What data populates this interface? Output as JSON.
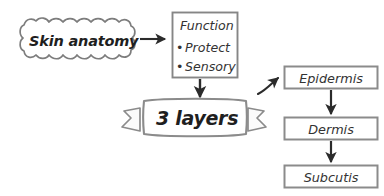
{
  "diagram": {
    "background_color": "#ffffff",
    "stroke_color": "#808080",
    "arrow_color": "#2b2b2b",
    "text_color": "#333333"
  },
  "cloud": {
    "label": "Skin anatomy",
    "shape": "wavy-rounded-rectangle"
  },
  "function_box": {
    "title": "Function",
    "bullets": [
      {
        "marker": "•",
        "label": "Protect"
      },
      {
        "marker": "•",
        "label": "Sensory"
      }
    ]
  },
  "banner": {
    "label": "3 layers",
    "shape": "ribbon-banner"
  },
  "layers": {
    "items": [
      {
        "label": "Epidermis"
      },
      {
        "label": "Dermis"
      },
      {
        "label": "Subcutis"
      }
    ]
  },
  "connectors": [
    {
      "name": "cloud-to-function",
      "direction": "right",
      "style": "straight"
    },
    {
      "name": "function-to-banner",
      "direction": "down",
      "style": "straight"
    },
    {
      "name": "banner-to-epidermis",
      "direction": "up-right",
      "style": "curved"
    },
    {
      "name": "epidermis-to-dermis",
      "direction": "down",
      "style": "straight"
    },
    {
      "name": "dermis-to-subcutis",
      "direction": "down",
      "style": "straight"
    }
  ]
}
